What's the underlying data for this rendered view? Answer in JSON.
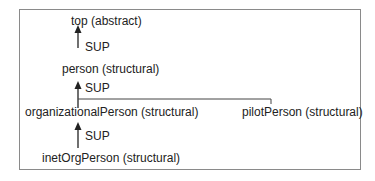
{
  "diagram": {
    "title": "",
    "nodes": [
      {
        "id": "top",
        "label": "top (abstract)"
      },
      {
        "id": "person",
        "label": "person (structural)"
      },
      {
        "id": "organizationalPerson",
        "label": "organizationalPerson (structural)"
      },
      {
        "id": "pilotPerson",
        "label": "pilotPerson (structural)"
      },
      {
        "id": "inetOrgPerson",
        "label": "inetOrgPerson (structural)"
      }
    ],
    "edges": [
      {
        "from": "person",
        "to": "top",
        "label": "SUP"
      },
      {
        "from": "organizationalPerson",
        "to": "person",
        "label": "SUP"
      },
      {
        "from": "pilotPerson",
        "to": "person",
        "label": ""
      },
      {
        "from": "inetOrgPerson",
        "to": "organizationalPerson",
        "label": "SUP"
      }
    ],
    "colors": {
      "line": "#222222",
      "border": "#8a8a8a",
      "background": "#ffffff"
    }
  }
}
